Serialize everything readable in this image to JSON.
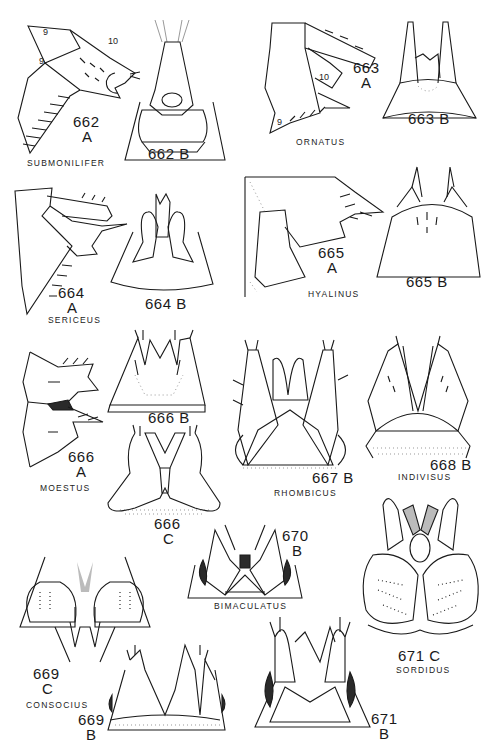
{
  "plate": {
    "background": "#ffffff",
    "ink": "#1a1a1a",
    "figures": [
      {
        "id": "662A",
        "number": "662",
        "view": "A",
        "species": "SUBMONILIFER",
        "segment_labels": [
          "9",
          "10",
          "9"
        ]
      },
      {
        "id": "662B",
        "number": "662",
        "view": "B",
        "label": "662 B"
      },
      {
        "id": "663A",
        "number": "663",
        "view": "A",
        "species": "ORNATUS",
        "segment_labels": [
          "10",
          "9"
        ]
      },
      {
        "id": "663B",
        "number": "663",
        "view": "B",
        "label": "663 B"
      },
      {
        "id": "664A",
        "number": "664",
        "view": "A",
        "species": "SERICEUS"
      },
      {
        "id": "664B",
        "number": "664",
        "view": "B",
        "label": "664 B"
      },
      {
        "id": "665A",
        "number": "665",
        "view": "A",
        "species": "HYALINUS"
      },
      {
        "id": "665B",
        "number": "665",
        "view": "B",
        "label": "665 B"
      },
      {
        "id": "666A",
        "number": "666",
        "view": "A",
        "species": "MOESTUS"
      },
      {
        "id": "666B",
        "number": "666",
        "view": "B",
        "label": "666 B"
      },
      {
        "id": "666C",
        "number": "666",
        "view": "C"
      },
      {
        "id": "667B",
        "number": "667",
        "view": "B",
        "label": "667 B",
        "species": "RHOMBICUS"
      },
      {
        "id": "668B",
        "number": "668",
        "view": "B",
        "label": "668 B",
        "species": "INDIVISUS"
      },
      {
        "id": "669C",
        "number": "669",
        "view": "C",
        "species": "CONSOCIUS"
      },
      {
        "id": "669B",
        "number": "669",
        "view": "B"
      },
      {
        "id": "670B",
        "number": "670",
        "view": "B",
        "species": "BIMACULATUS"
      },
      {
        "id": "671C",
        "number": "671",
        "view": "C",
        "label": "671 C",
        "species": "SORDIDUS"
      },
      {
        "id": "671B",
        "number": "671",
        "view": "B"
      }
    ]
  },
  "labels": {
    "f662a_num": "662",
    "f662a_view": "A",
    "f662a_sp": "SUBMONILIFER",
    "f662a_seg1": "9",
    "f662a_seg2": "10",
    "f662a_seg3": "9",
    "f662b": "662 B",
    "f663a_num": "663",
    "f663a_view": "A",
    "f663a_sp": "ORNATUS",
    "f663a_seg1": "10",
    "f663a_seg2": "9",
    "f663b": "663 B",
    "f664a_num": "664",
    "f664a_view": "A",
    "f664a_sp": "SERICEUS",
    "f664b": "664 B",
    "f665a_num": "665",
    "f665a_view": "A",
    "f665a_sp": "HYALINUS",
    "f665b": "665 B",
    "f666a_num": "666",
    "f666a_view": "A",
    "f666a_sp": "MOESTUS",
    "f666b": "666 B",
    "f666c_num": "666",
    "f666c_view": "C",
    "f667b": "667 B",
    "f667b_sp": "RHOMBICUS",
    "f668b": "668 B",
    "f668b_sp": "INDIVISUS",
    "f669c_num": "669",
    "f669c_view": "C",
    "f669c_sp": "CONSOCIUS",
    "f669b_num": "669",
    "f669b_view": "B",
    "f670b_num": "670",
    "f670b_view": "B",
    "f670b_sp": "BIMACULATUS",
    "f671c": "671 C",
    "f671c_sp": "SORDIDUS",
    "f671b_num": "671",
    "f671b_view": "B"
  }
}
